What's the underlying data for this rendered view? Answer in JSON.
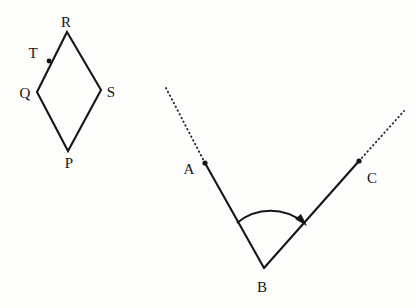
{
  "figure": {
    "background_color": "#fdfdfc",
    "stroke_color": "#161616",
    "figures": [
      {
        "name": "rhombus-pqrs",
        "shape": "rhombus",
        "vertices": [
          {
            "label": "R",
            "x": 67,
            "y": 32,
            "label_x": 66,
            "label_y": 27
          },
          {
            "label": "S",
            "x": 101,
            "y": 90,
            "label_x": 111,
            "label_y": 97
          },
          {
            "label": "P",
            "x": 68,
            "y": 151,
            "label_x": 69,
            "label_y": 168
          },
          {
            "label": "Q",
            "x": 37,
            "y": 92,
            "label_x": 25,
            "label_y": 98
          }
        ],
        "marked_points": [
          {
            "label": "T",
            "x": 49,
            "y": 61,
            "label_x": 33,
            "label_y": 58,
            "on_segment": "QR"
          }
        ]
      },
      {
        "name": "angle-abc",
        "shape": "angle",
        "vertices": [
          {
            "label": "A",
            "x": 205,
            "y": 163,
            "label_x": 189,
            "label_y": 174
          },
          {
            "label": "B",
            "x": 264,
            "y": 268,
            "label_x": 262,
            "label_y": 292
          },
          {
            "label": "C",
            "x": 359,
            "y": 161,
            "label_x": 372,
            "label_y": 183
          }
        ],
        "rays": [
          {
            "name": "ray-ba",
            "from": "B",
            "to": "A"
          },
          {
            "name": "ray-bc",
            "from": "B",
            "to": "C"
          }
        ],
        "dotted_extensions": [
          {
            "name": "dotted-extension-a",
            "from_x": 205,
            "from_y": 163,
            "to_x": 166,
            "to_y": 88
          },
          {
            "name": "dotted-extension-c",
            "from_x": 359,
            "from_y": 161,
            "to_x": 404,
            "to_y": 111
          }
        ],
        "arc": {
          "name": "angle-arc-abc",
          "center_x": 264,
          "center_y": 268,
          "radius": 52,
          "start_x": 237,
          "start_y": 223,
          "end_x": 305,
          "end_y": 222,
          "direction": "counterclockwise-sweep-from-ba-to-bc",
          "arrow_at": "end"
        }
      }
    ]
  }
}
